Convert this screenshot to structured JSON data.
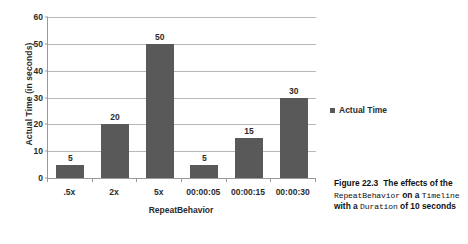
{
  "chart_data": {
    "type": "bar",
    "title": "",
    "categories": [
      ".5x",
      "2x",
      "5x",
      "00:00:05",
      "00:00:15",
      "00:00:30"
    ],
    "values": [
      5,
      20,
      50,
      5,
      15,
      30
    ],
    "series": [
      {
        "name": "Actual Time",
        "values": [
          5,
          20,
          50,
          5,
          15,
          30
        ]
      }
    ],
    "xlabel": "RepeatBehavior",
    "ylabel": "Actual Time (in seconds)",
    "ylim": [
      0,
      60
    ],
    "yticks": [
      0,
      10,
      20,
      30,
      40,
      50,
      60
    ],
    "ytick_labels": [
      "0",
      "10",
      "20",
      "30",
      "40",
      "50",
      "60"
    ],
    "data_labels": [
      "5",
      "20",
      "50",
      "5",
      "15",
      "30"
    ],
    "grid": true,
    "legend_position": "right",
    "bar_color": "#595959",
    "gridline_color": "#b7b7b7",
    "axis_color": "#9a9a9a"
  },
  "legend": {
    "entries": [
      {
        "label": "Actual Time",
        "color": "#595959",
        "marker": "square-marker"
      }
    ]
  },
  "caption": {
    "figure_number": "Figure 22.3",
    "text_1": "The effects",
    "text_2": "of the",
    "code_1": "RepeatBehavior",
    "text_3": "on a",
    "code_2": "Timeline",
    "text_4": "with a",
    "code_3": "Duration",
    "text_5": "of 10 seconds"
  }
}
